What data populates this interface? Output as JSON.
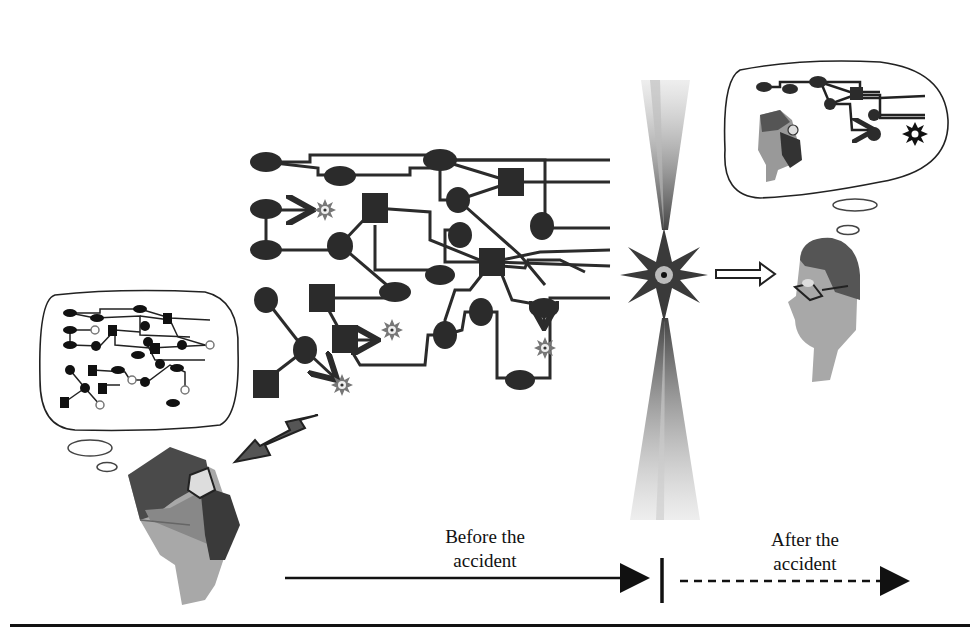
{
  "figure": {
    "timeline": {
      "before_label_line1": "Before the",
      "before_label_line2": "accident",
      "after_label_line1": "After the",
      "after_label_line2": "accident",
      "before_style": "solid-arrow",
      "after_style": "dashed-arrow"
    },
    "elements": {
      "left_actor": "surgeon-with-cap-and-mask",
      "left_thought": "complex-network-of-possible-paths",
      "center_event": "accident-starburst",
      "right_actor": "observer-with-glasses",
      "right_thought": "single-linear-path-to-accident"
    },
    "colors": {
      "ink": "#1a1a1a",
      "node": "#2b2b2b",
      "skin": "#a8a8a8",
      "cap": "#4a4a4a",
      "mask": "#3a3a3a",
      "burst": "#8a8a8a",
      "background": "#ffffff"
    }
  }
}
